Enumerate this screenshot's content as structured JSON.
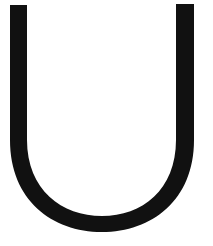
{
  "glyph": {
    "character": "U",
    "fill_color": "#111111",
    "background_color": "#ffffff"
  }
}
